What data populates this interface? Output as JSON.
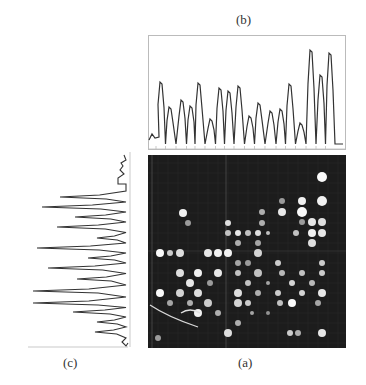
{
  "labels": {
    "b": "(b)",
    "a": "(a)",
    "c": "(c)"
  },
  "colors": {
    "line": "#333333",
    "frame": "#bbbbbb",
    "panel_bg": "#1c1c1c",
    "spot": "#e8e8e8",
    "grid": "#555555"
  },
  "chart_data": [
    {
      "type": "line",
      "title": "(b)",
      "description": "Horizontal intensity projection profile of image (a)",
      "xlabel": "",
      "ylabel": "",
      "grid": false,
      "peaks": {
        "x_px": [
          161,
          170,
          182,
          191,
          199,
          211,
          220,
          229,
          239,
          250,
          259,
          271,
          281,
          290,
          301,
          311,
          321,
          330
        ],
        "height": [
          64,
          39,
          46,
          40,
          63,
          27,
          58,
          55,
          60,
          30,
          43,
          35,
          37,
          62,
          23,
          96,
          71,
          93
        ]
      },
      "ylim": [
        0,
        110
      ]
    },
    {
      "type": "line",
      "title": "(c)",
      "description": "Vertical intensity projection profile of image (a), plotted rotated (peaks extend leftward)",
      "xlabel": "",
      "ylabel": "",
      "grid": false,
      "peaks": {
        "y_px": [
          197,
          207,
          217,
          227,
          238,
          248,
          258,
          268,
          279,
          291,
          303,
          312,
          322,
          332
        ],
        "depth": [
          66,
          84,
          51,
          69,
          29,
          89,
          38,
          78,
          49,
          93,
          93,
          53,
          29,
          31
        ]
      },
      "xlim": [
        0,
        100
      ]
    }
  ],
  "panel_a": {
    "title": "(a)",
    "description": "Microarray fluorescence image, dark background with bright spots on a grid",
    "spots": [
      [
        322,
        22,
        5,
        1.0
      ],
      [
        302,
        46,
        4,
        0.95
      ],
      [
        322,
        46,
        5,
        0.95
      ],
      [
        282,
        46,
        3,
        0.5
      ],
      [
        302,
        57,
        5,
        1.0
      ],
      [
        282,
        57,
        4,
        0.9
      ],
      [
        262,
        57,
        3,
        0.6
      ],
      [
        302,
        67,
        3,
        0.5
      ],
      [
        312,
        67,
        4,
        0.9
      ],
      [
        322,
        67,
        4,
        0.85
      ],
      [
        183,
        58,
        4,
        0.95
      ],
      [
        188,
        68,
        3,
        0.5
      ],
      [
        228,
        68,
        3,
        0.85
      ],
      [
        262,
        68,
        3,
        0.6
      ],
      [
        238,
        78,
        3,
        0.9
      ],
      [
        248,
        78,
        3,
        0.7
      ],
      [
        258,
        78,
        3,
        0.85
      ],
      [
        268,
        78,
        2,
        0.7
      ],
      [
        312,
        78,
        4,
        0.95
      ],
      [
        322,
        78,
        4,
        0.9
      ],
      [
        296,
        78,
        3,
        0.7
      ],
      [
        228,
        78,
        3,
        0.7
      ],
      [
        238,
        88,
        3,
        0.6
      ],
      [
        258,
        88,
        3,
        0.55
      ],
      [
        312,
        88,
        4,
        0.85
      ],
      [
        160,
        98,
        4,
        1.0
      ],
      [
        170,
        98,
        3,
        0.75
      ],
      [
        180,
        98,
        4,
        0.85
      ],
      [
        208,
        98,
        4,
        0.9
      ],
      [
        218,
        98,
        4,
        0.95
      ],
      [
        228,
        98,
        4,
        0.95
      ],
      [
        258,
        98,
        4,
        0.8
      ],
      [
        238,
        108,
        3,
        0.55
      ],
      [
        278,
        108,
        3,
        0.75
      ],
      [
        322,
        108,
        3,
        0.75
      ],
      [
        248,
        108,
        3,
        0.5
      ],
      [
        180,
        118,
        4,
        0.85
      ],
      [
        198,
        118,
        4,
        0.95
      ],
      [
        218,
        118,
        4,
        0.9
      ],
      [
        238,
        118,
        3,
        0.7
      ],
      [
        258,
        118,
        4,
        0.7
      ],
      [
        282,
        118,
        3,
        0.65
      ],
      [
        302,
        118,
        3,
        0.7
      ],
      [
        322,
        118,
        3,
        0.75
      ],
      [
        190,
        128,
        4,
        0.9
      ],
      [
        210,
        128,
        3,
        0.5
      ],
      [
        248,
        128,
        3,
        0.7
      ],
      [
        268,
        128,
        2,
        0.55
      ],
      [
        292,
        128,
        3,
        0.8
      ],
      [
        312,
        128,
        3,
        0.65
      ],
      [
        160,
        138,
        4,
        1.0
      ],
      [
        180,
        138,
        4,
        0.8
      ],
      [
        198,
        138,
        4,
        0.85
      ],
      [
        238,
        138,
        4,
        0.85
      ],
      [
        258,
        138,
        3,
        0.6
      ],
      [
        278,
        138,
        3,
        0.75
      ],
      [
        302,
        138,
        3,
        0.8
      ],
      [
        322,
        138,
        4,
        0.9
      ],
      [
        170,
        148,
        3,
        0.55
      ],
      [
        190,
        148,
        3,
        0.6
      ],
      [
        208,
        148,
        4,
        0.75
      ],
      [
        238,
        148,
        4,
        0.8
      ],
      [
        248,
        148,
        3,
        0.75
      ],
      [
        280,
        148,
        3,
        0.7
      ],
      [
        292,
        148,
        4,
        1.0
      ],
      [
        318,
        148,
        3,
        0.55
      ],
      [
        198,
        158,
        4,
        0.95
      ],
      [
        218,
        158,
        3,
        0.6
      ],
      [
        252,
        158,
        2,
        0.55
      ],
      [
        268,
        158,
        2,
        0.45
      ],
      [
        238,
        168,
        3,
        0.6
      ],
      [
        228,
        178,
        4,
        0.85
      ],
      [
        290,
        178,
        3,
        0.75
      ],
      [
        298,
        178,
        3,
        0.6
      ],
      [
        322,
        178,
        4,
        0.9
      ],
      [
        158,
        183,
        3,
        0.5
      ]
    ]
  }
}
